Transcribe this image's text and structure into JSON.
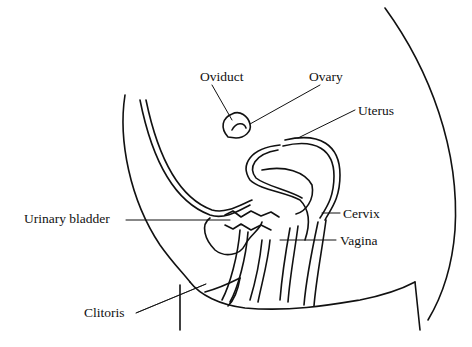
{
  "diagram": {
    "type": "anatomical line drawing",
    "labels": [
      {
        "id": "oviduct",
        "text": "Oviduct"
      },
      {
        "id": "ovary",
        "text": "Ovary"
      },
      {
        "id": "uterus",
        "text": "Uterus"
      },
      {
        "id": "cervix",
        "text": "Cervix"
      },
      {
        "id": "urinary_bladder",
        "text": "Urinary bladder"
      },
      {
        "id": "vagina",
        "text": "Vagina"
      },
      {
        "id": "clitoris",
        "text": "Clitoris"
      }
    ]
  }
}
